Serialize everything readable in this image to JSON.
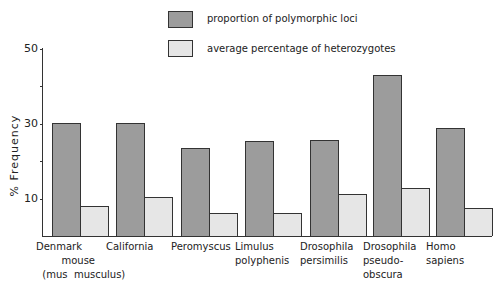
{
  "chart_data": {
    "type": "bar",
    "title": "",
    "xlabel": "",
    "ylabel": "% Frequency",
    "ylim": [
      0,
      50
    ],
    "yticks": [
      10,
      30,
      50
    ],
    "grid": false,
    "legend_position": "top",
    "categories": [
      "Denmark mouse (mus musculus)",
      "California",
      "Peromyscus",
      "Limulus polyphenis",
      "Drosophila persimilis",
      "Drosophila pseudo-obscura",
      "Homo sapiens"
    ],
    "category_labels": [
      "Denmark\n        mouse\n  (mus  musculus)",
      "California",
      "Peromyscus",
      "Limulus\npolyphenis",
      "Drosophila\npersimilis",
      "Drosophila\npseudo-\nobscura",
      "Homo\nsapiens"
    ],
    "series": [
      {
        "name": "proportion of polymorphic loci",
        "color": "#9c9c9c",
        "values": [
          30.2,
          30.2,
          23.5,
          25.4,
          25.7,
          43.0,
          28.9
        ]
      },
      {
        "name": "average percentage of heterozygotes",
        "color": "#e6e6e6",
        "values": [
          8.0,
          10.4,
          6.1,
          6.1,
          11.2,
          12.8,
          7.5
        ]
      }
    ]
  },
  "legend": {
    "items": [
      {
        "label": "proportion of polymorphic loci",
        "color": "#9c9c9c"
      },
      {
        "label": "average percentage of heterozygotes",
        "color": "#e6e6e6"
      }
    ]
  },
  "axis": {
    "ylabel": "% Frequency",
    "ticks": [
      {
        "value": 50,
        "label": "50"
      },
      {
        "value": 30,
        "label": "30"
      },
      {
        "value": 10,
        "label": "10"
      }
    ]
  }
}
